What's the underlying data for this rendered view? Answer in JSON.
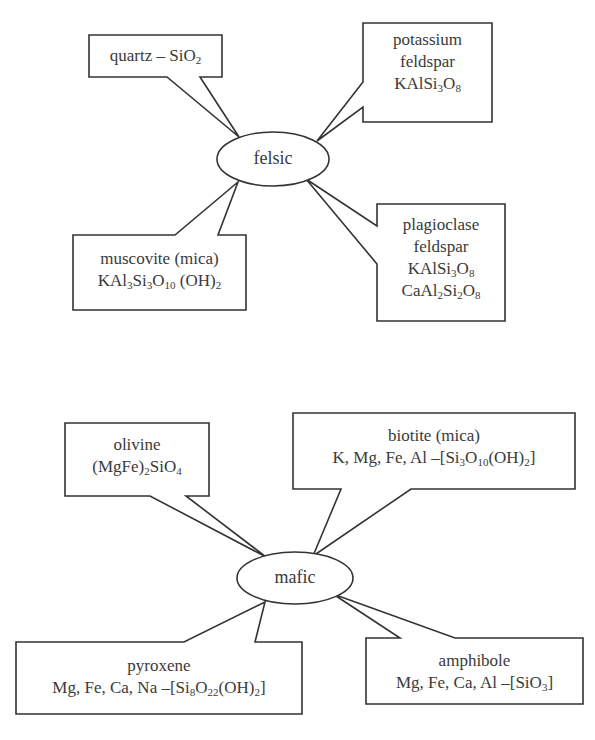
{
  "diagram": {
    "title": "",
    "stroke_color": "#333333",
    "groups": [
      {
        "id": "felsic",
        "center_label": "felsic",
        "callouts": [
          {
            "id": "quartz",
            "lines": [
              {
                "parts": [
                  [
                    "quartz – SiO",
                    ""
                  ],
                  [
                    "2",
                    "sub"
                  ]
                ]
              }
            ]
          },
          {
            "id": "potassium-feldspar",
            "lines": [
              {
                "parts": [
                  [
                    "potassium",
                    ""
                  ]
                ]
              },
              {
                "parts": [
                  [
                    "feldspar",
                    ""
                  ]
                ]
              },
              {
                "parts": [
                  [
                    "KAlSi",
                    ""
                  ],
                  [
                    "3",
                    "sub"
                  ],
                  [
                    "O",
                    ""
                  ],
                  [
                    "8",
                    "sub"
                  ]
                ]
              }
            ]
          },
          {
            "id": "muscovite",
            "lines": [
              {
                "parts": [
                  [
                    "muscovite (mica)",
                    ""
                  ]
                ]
              },
              {
                "parts": [
                  [
                    "KAl",
                    ""
                  ],
                  [
                    "3",
                    "sub"
                  ],
                  [
                    "Si",
                    ""
                  ],
                  [
                    "3",
                    "sub"
                  ],
                  [
                    "O",
                    ""
                  ],
                  [
                    "10",
                    "sub"
                  ],
                  [
                    " (OH)",
                    ""
                  ],
                  [
                    "2",
                    "sub"
                  ]
                ]
              }
            ]
          },
          {
            "id": "plagioclase-feldspar",
            "lines": [
              {
                "parts": [
                  [
                    "plagioclase",
                    ""
                  ]
                ]
              },
              {
                "parts": [
                  [
                    "feldspar",
                    ""
                  ]
                ]
              },
              {
                "parts": [
                  [
                    "KAlSi",
                    ""
                  ],
                  [
                    "3",
                    "sub"
                  ],
                  [
                    "O",
                    ""
                  ],
                  [
                    "8",
                    "sub"
                  ]
                ]
              },
              {
                "parts": [
                  [
                    "CaAl",
                    ""
                  ],
                  [
                    "2",
                    "sub"
                  ],
                  [
                    "Si",
                    ""
                  ],
                  [
                    "2",
                    "sub"
                  ],
                  [
                    "O",
                    ""
                  ],
                  [
                    "8",
                    "sub"
                  ]
                ]
              }
            ]
          }
        ]
      },
      {
        "id": "mafic",
        "center_label": "mafic",
        "callouts": [
          {
            "id": "olivine",
            "lines": [
              {
                "parts": [
                  [
                    "olivine",
                    ""
                  ]
                ]
              },
              {
                "parts": [
                  [
                    "(MgFe)",
                    ""
                  ],
                  [
                    "2",
                    "sub"
                  ],
                  [
                    "SiO",
                    ""
                  ],
                  [
                    "4",
                    "sub"
                  ]
                ]
              }
            ]
          },
          {
            "id": "biotite",
            "lines": [
              {
                "parts": [
                  [
                    "biotite (mica)",
                    ""
                  ]
                ]
              },
              {
                "parts": [
                  [
                    "K, Mg, Fe, Al –[Si",
                    ""
                  ],
                  [
                    "3",
                    "sub"
                  ],
                  [
                    "O",
                    ""
                  ],
                  [
                    "10",
                    "sub"
                  ],
                  [
                    "(OH)",
                    ""
                  ],
                  [
                    "2",
                    "sub"
                  ],
                  [
                    "]",
                    ""
                  ]
                ]
              }
            ]
          },
          {
            "id": "pyroxene",
            "lines": [
              {
                "parts": [
                  [
                    "pyroxene",
                    ""
                  ]
                ]
              },
              {
                "parts": [
                  [
                    "Mg, Fe, Ca, Na –[Si",
                    ""
                  ],
                  [
                    "8",
                    "sub"
                  ],
                  [
                    "O",
                    ""
                  ],
                  [
                    "22",
                    "sub"
                  ],
                  [
                    "(OH)",
                    ""
                  ],
                  [
                    "2",
                    "sub"
                  ],
                  [
                    "]",
                    ""
                  ]
                ]
              }
            ]
          },
          {
            "id": "amphibole",
            "lines": [
              {
                "parts": [
                  [
                    "amphibole",
                    ""
                  ]
                ]
              },
              {
                "parts": [
                  [
                    "Mg, Fe, Ca, Al –[SiO",
                    ""
                  ],
                  [
                    "3",
                    "sub"
                  ],
                  [
                    "]",
                    ""
                  ]
                ]
              }
            ]
          }
        ]
      }
    ]
  },
  "labels": {
    "felsic": "felsic",
    "mafic": "mafic"
  }
}
